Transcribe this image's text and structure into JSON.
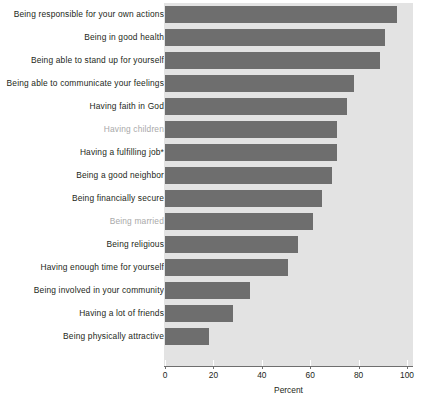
{
  "chart_data": {
    "type": "bar",
    "orientation": "horizontal",
    "title": "",
    "xlabel": "Percent",
    "ylabel": "",
    "xlim": [
      0,
      100
    ],
    "xticks": [
      0,
      20,
      40,
      60,
      80,
      100
    ],
    "grid": false,
    "legend": null,
    "bar_color": "#6e6e6e",
    "panel_color": "#e3e3e3",
    "categories": [
      "Being responsible for your own actions",
      "Being in good health",
      "Being able to stand up for yourself",
      "Being able to communicate your feelings",
      "Having faith in God",
      "Having children",
      "Having a fulfilling job*",
      "Being a good neighbor",
      "Being financially secure",
      "Being married",
      "Being religious",
      "Having enough time for yourself",
      "Being involved in your community",
      "Having a lot of friends",
      "Being physically attractive"
    ],
    "values": [
      96,
      91,
      89,
      78,
      75,
      71,
      71,
      69,
      65,
      61,
      55,
      51,
      35,
      28,
      18
    ],
    "muted_categories": [
      "Having children",
      "Being married"
    ],
    "annotations": [
      "*"
    ]
  },
  "axis": {
    "tick_labels": [
      "0",
      "20",
      "40",
      "60",
      "80",
      "100"
    ],
    "title": "Percent"
  },
  "footnote": {
    "text": ""
  }
}
